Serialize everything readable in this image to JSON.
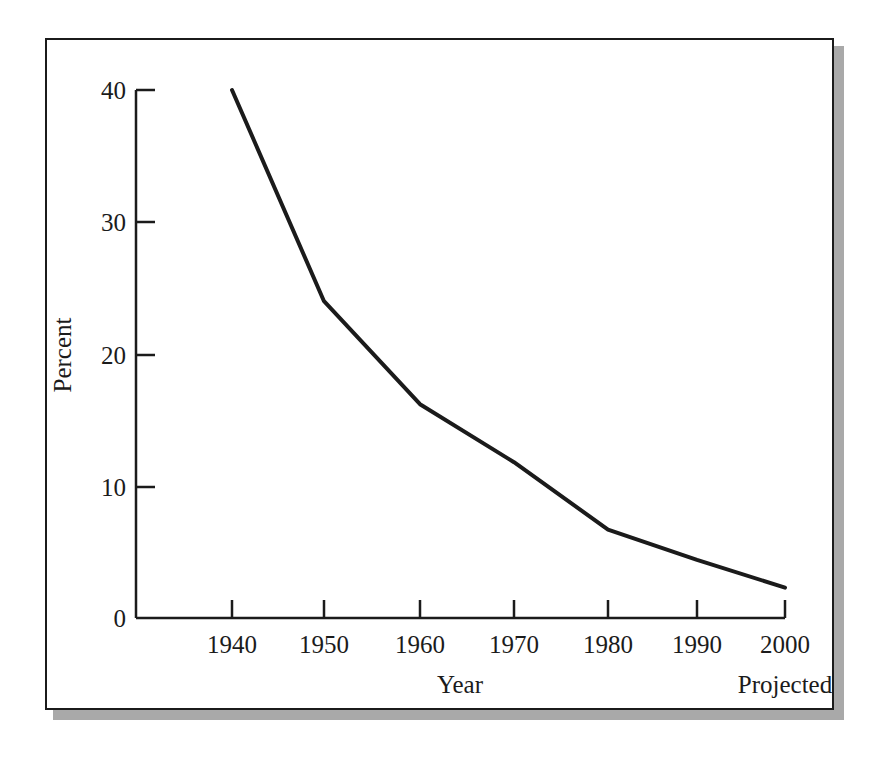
{
  "chart_data": {
    "type": "line",
    "title": "",
    "xlabel": "Year",
    "ylabel": "Percent",
    "annotation": "Projected",
    "x": [
      1940,
      1950,
      1960,
      1970,
      1980,
      1990,
      2000
    ],
    "xtick_labels": [
      "1940",
      "1950",
      "1960",
      "1970",
      "1980",
      "1990",
      "2000"
    ],
    "ytick_labels": [
      "0",
      "10",
      "20",
      "30",
      "40"
    ],
    "yticks": [
      0,
      10,
      20,
      30,
      40
    ],
    "ylim": [
      0,
      40
    ],
    "xlim": [
      1933,
      2003
    ],
    "grid": false,
    "legend": null,
    "series": [
      {
        "name": "Percent",
        "values": [
          40.0,
          24.0,
          16.2,
          11.8,
          6.7,
          4.4,
          2.3
        ]
      }
    ],
    "line_color": "#1b1b1b",
    "line_width": 4,
    "axis_color": "#1b1b1b",
    "background": "#ffffff",
    "frame_shadow_color": "#a9a9a9"
  },
  "ytick_0": "0",
  "ytick_1": "10",
  "ytick_2": "20",
  "ytick_3": "30",
  "ytick_4": "40",
  "xtick_0": "1940",
  "xtick_1": "1950",
  "xtick_2": "1960",
  "xtick_3": "1970",
  "xtick_4": "1980",
  "xtick_5": "1990",
  "xtick_6": "2000",
  "axis_label_y": "Percent",
  "axis_label_x": "Year",
  "axis_note": "Projected"
}
